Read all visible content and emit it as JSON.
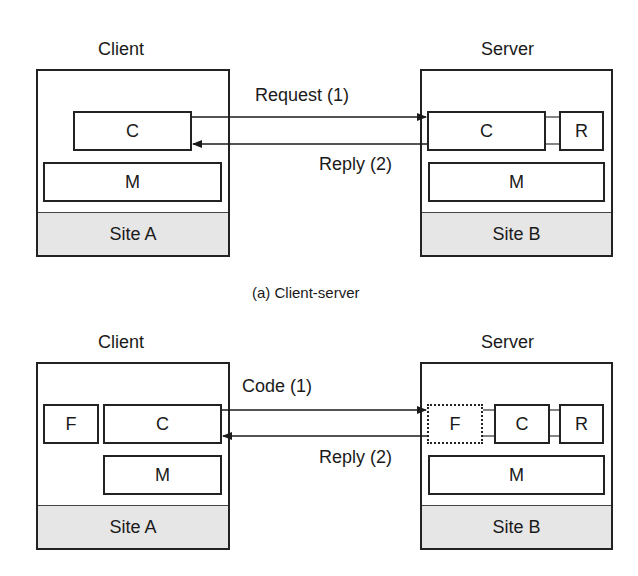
{
  "diagrams": [
    {
      "id": "client-server",
      "caption": "(a) Client-server",
      "client": {
        "title": "Client",
        "site": "Site A",
        "components": [
          "C",
          "M"
        ]
      },
      "server": {
        "title": "Server",
        "site": "Site B",
        "components": [
          "C",
          "R",
          "M"
        ]
      },
      "messages": [
        {
          "label": "Request (1)",
          "direction": "client-to-server"
        },
        {
          "label": "Reply (2)",
          "direction": "server-to-client"
        }
      ]
    },
    {
      "id": "remote-evaluation",
      "client": {
        "title": "Client",
        "site": "Site A",
        "components": [
          "F",
          "C",
          "M"
        ]
      },
      "server": {
        "title": "Server",
        "site": "Site B",
        "components": [
          "F",
          "C",
          "R",
          "M"
        ],
        "transferred_component": "F"
      },
      "messages": [
        {
          "label": "Code (1)",
          "direction": "client-to-server"
        },
        {
          "label": "Reply (2)",
          "direction": "server-to-client"
        }
      ]
    }
  ]
}
